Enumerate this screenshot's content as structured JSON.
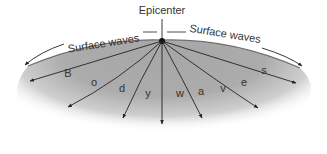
{
  "diagram": {
    "epicenter_label": "Epicenter",
    "surface_left_label": "Surface waves",
    "surface_right_label": "Surface waves",
    "body_wave_letters": [
      "B",
      "o",
      "d",
      "y",
      "w",
      "a",
      "v",
      "e",
      "s"
    ],
    "colors": {
      "ground": "#a9a9a9",
      "line": "#222222",
      "text": "#333333",
      "background": "#ffffff"
    }
  }
}
